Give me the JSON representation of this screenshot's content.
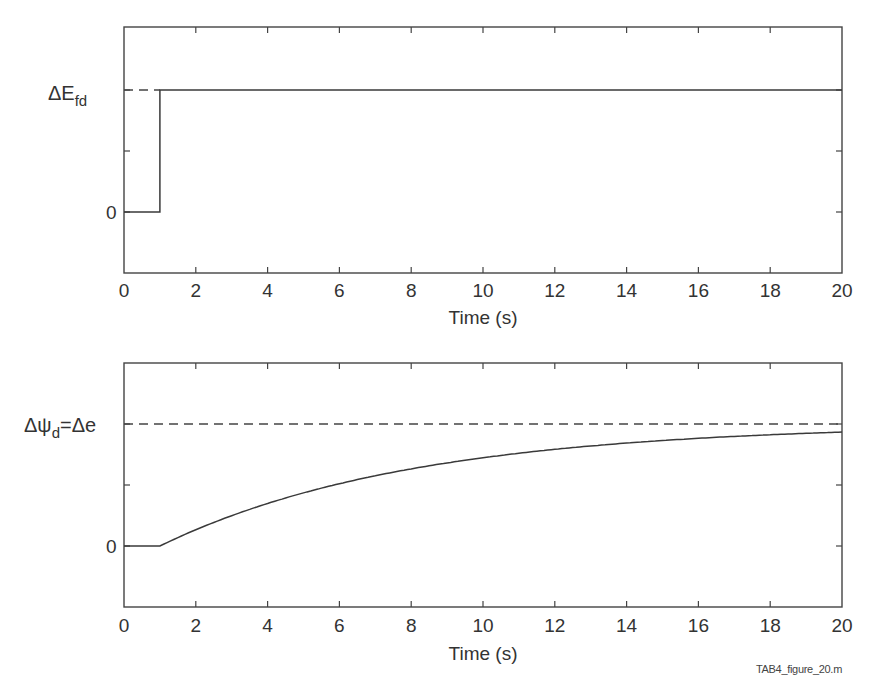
{
  "chart_data": [
    {
      "type": "line",
      "title": "",
      "xlabel": "Time (s)",
      "ylabel": "ΔE_fd",
      "xlim": [
        0,
        20
      ],
      "x_ticks": [
        0,
        2,
        4,
        6,
        8,
        10,
        12,
        14,
        16,
        18,
        20
      ],
      "y_tick_labels": [
        {
          "value": 0,
          "label": "0"
        },
        {
          "value": 1,
          "label": "ΔE_fd"
        }
      ],
      "ylim": [
        -0.5,
        1.5
      ],
      "grid": false,
      "series": [
        {
          "name": "ΔE_fd step input",
          "style": "solid",
          "x": [
            0,
            1,
            1,
            20
          ],
          "y": [
            0,
            0,
            1,
            1
          ]
        },
        {
          "name": "ΔE_fd reference level",
          "style": "dashed",
          "x": [
            0,
            1
          ],
          "y": [
            1,
            1
          ]
        }
      ]
    },
    {
      "type": "line",
      "title": "",
      "xlabel": "Time (s)",
      "ylabel": "Δψ_d=Δe",
      "xlim": [
        0,
        20
      ],
      "x_ticks": [
        0,
        2,
        4,
        6,
        8,
        10,
        12,
        14,
        16,
        18,
        20
      ],
      "y_tick_labels": [
        {
          "value": 0,
          "label": "0"
        },
        {
          "value": 1,
          "label": "Δψ_d=Δe"
        }
      ],
      "ylim": [
        -0.5,
        1.5
      ],
      "grid": false,
      "series": [
        {
          "name": "Δψ_d response",
          "style": "solid",
          "x": [
            0,
            1,
            2,
            4,
            6,
            8,
            10,
            12,
            14,
            16,
            18,
            20
          ],
          "y": [
            0,
            0,
            0.13,
            0.35,
            0.51,
            0.63,
            0.73,
            0.79,
            0.85,
            0.89,
            0.92,
            0.94
          ]
        },
        {
          "name": "final value Δe",
          "style": "dashed",
          "x": [
            0,
            20
          ],
          "y": [
            1,
            1
          ]
        }
      ]
    }
  ],
  "top_plot": {
    "ylabel_main": "ΔE",
    "ylabel_sub": "fd",
    "zero_label": "0",
    "xlabel": "Time (s)",
    "x_tick_labels": [
      "0",
      "2",
      "4",
      "6",
      "8",
      "10",
      "12",
      "14",
      "16",
      "18",
      "20"
    ]
  },
  "bottom_plot": {
    "ylabel_part1": "Δψ",
    "ylabel_sub": "d",
    "ylabel_part2": "=Δe",
    "zero_label": "0",
    "xlabel": "Time (s)",
    "x_tick_labels": [
      "0",
      "2",
      "4",
      "6",
      "8",
      "10",
      "12",
      "14",
      "16",
      "18",
      "20"
    ]
  },
  "footer": {
    "filename": "TAB4_figure_20.m"
  },
  "colors": {
    "line": "#3a3a3a",
    "axis": "#444444",
    "background": "#ffffff"
  }
}
